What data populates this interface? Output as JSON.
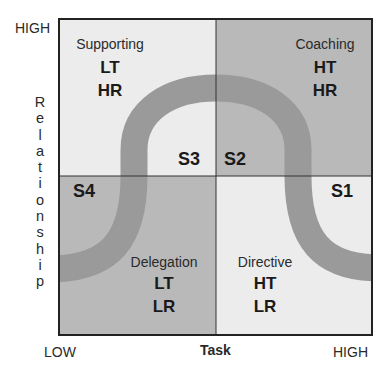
{
  "diagram": {
    "type": "situational-leadership-quadrant",
    "y_axis": {
      "title": "Relationship",
      "title_letters": [
        "R",
        "e",
        "l",
        "a",
        "t",
        "i",
        "o",
        "n",
        "s",
        "h",
        "i",
        "p"
      ],
      "high_label": "HIGH"
    },
    "x_axis": {
      "title": "Task",
      "low_label": "LOW",
      "high_label": "HIGH"
    },
    "quadrants": [
      {
        "id": "top-left",
        "name": "Supporting",
        "code1": "LT",
        "code2": "HR",
        "style": "S3",
        "fill": "#ececec"
      },
      {
        "id": "top-right",
        "name": "Coaching",
        "code1": "HT",
        "code2": "HR",
        "style": "S2",
        "fill": "#b9b9b9"
      },
      {
        "id": "bottom-left",
        "name": "Delegation",
        "code1": "LT",
        "code2": "LR",
        "style": "S4",
        "fill": "#b9b9b9"
      },
      {
        "id": "bottom-right",
        "name": "Directive",
        "code1": "HT",
        "code2": "LR",
        "style": "S1",
        "fill": "#ececec"
      }
    ],
    "style_labels": {
      "s1": "S1",
      "s2": "S2",
      "s3": "S3",
      "s4": "S4"
    },
    "colors": {
      "curve": "#9a9a9a",
      "border": "#222222",
      "light_quadrant": "#ececec",
      "dark_quadrant": "#b9b9b9"
    }
  }
}
